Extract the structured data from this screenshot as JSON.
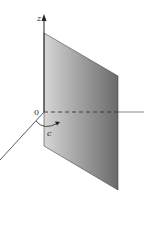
{
  "diagram": {
    "labels": {
      "z_axis": "z",
      "origin": "0",
      "angle": "c"
    },
    "colors": {
      "plane_light": "#d4d4d4",
      "plane_dark": "#6e6e6e",
      "axis": "#333333",
      "background": "#ffffff"
    }
  }
}
